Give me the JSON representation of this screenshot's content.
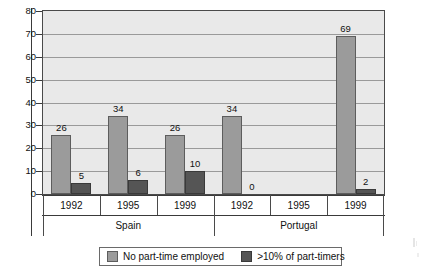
{
  "chart_data": {
    "type": "bar",
    "title": "",
    "xlabel": "",
    "ylabel": "",
    "ylim": [
      0,
      80
    ],
    "ytick_step": 10,
    "yticks": [
      80,
      70,
      60,
      50,
      40,
      30,
      20,
      10,
      0
    ],
    "grid": true,
    "legend_position": "bottom",
    "categories": [
      "1992",
      "1995",
      "1999",
      "1992",
      "1995",
      "1999"
    ],
    "groups": [
      {
        "label": "Spain",
        "categories": [
          "1992",
          "1995",
          "1999"
        ]
      },
      {
        "label": "Portugal",
        "categories": [
          "1992",
          "1995",
          "1999"
        ]
      }
    ],
    "series": [
      {
        "name": "No part-time employed",
        "color": "#9b9b9b",
        "values": [
          26,
          34,
          26,
          34,
          null,
          69
        ],
        "labels": [
          "26",
          "34",
          "26",
          "34",
          "",
          "69"
        ]
      },
      {
        "name": ">10% of part-timers",
        "color": "#555555",
        "values": [
          5,
          6,
          10,
          0,
          null,
          2
        ],
        "labels": [
          "5",
          "6",
          "10",
          "0",
          "",
          "2"
        ]
      }
    ]
  },
  "axis": {
    "y_ticks": [
      "80",
      "70",
      "60",
      "50",
      "40",
      "30",
      "20",
      "10",
      "0"
    ],
    "category_labels": [
      "1992",
      "1995",
      "1999",
      "1992",
      "1995",
      "1999"
    ],
    "group_labels": [
      "Spain",
      "Portugal"
    ]
  },
  "legend": {
    "items": [
      {
        "label": "No part-time employed",
        "swatch": "light-gray-swatch"
      },
      {
        "label": ">10% of part-timers",
        "swatch": "dark-gray-swatch"
      }
    ]
  },
  "colors": {
    "series_light": "#9b9b9b",
    "series_dark": "#555555",
    "plot_background": "#e9e9e9",
    "gridline": "#9a9a9a",
    "axis": "#3a3a3a"
  }
}
